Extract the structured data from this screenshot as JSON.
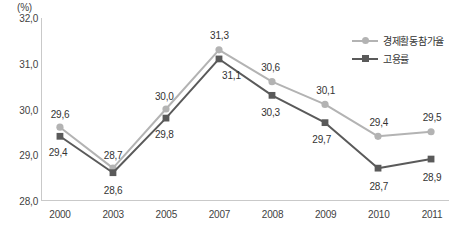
{
  "unit_label": "(%)",
  "colors": {
    "series_participation": "#b3b3b3",
    "series_employment": "#5a5a5a",
    "axis": "#c9c9c9",
    "text": "#333333",
    "background": "#ffffff"
  },
  "legend": {
    "position": "top-right",
    "items": [
      {
        "label": "경제활동참가율",
        "marker": "circle-marker",
        "color": "#b3b3b3"
      },
      {
        "label": "고용률",
        "marker": "square-marker",
        "color": "#5a5a5a"
      }
    ]
  },
  "y_axis": {
    "ticks": [
      "32,0",
      "31,0",
      "30,0",
      "29,0",
      "28,0"
    ],
    "min": 28.0,
    "max": 32.0,
    "step": 1.0
  },
  "x_axis": {
    "ticks": [
      "2000",
      "2003",
      "2005",
      "2007",
      "2008",
      "2009",
      "2010",
      "2011"
    ]
  },
  "data_labels": {
    "participation": [
      "29,6",
      "28,7",
      "30,0",
      "31,3",
      "30,6",
      "30,1",
      "29,4",
      "29,5"
    ],
    "employment": [
      "29,4",
      "28,6",
      "29,8",
      "31,1",
      "30,3",
      "29,7",
      "28,7",
      "28,9"
    ]
  },
  "chart_data": {
    "type": "line",
    "title": "",
    "subtitle": "",
    "xlabel": "",
    "ylabel": "(%)",
    "categories": [
      "2000",
      "2003",
      "2005",
      "2007",
      "2008",
      "2009",
      "2010",
      "2011"
    ],
    "series": [
      {
        "name": "경제활동참가율",
        "color": "#b3b3b3",
        "marker": "circle",
        "values": [
          29.6,
          28.7,
          30.0,
          31.3,
          30.6,
          30.1,
          29.4,
          29.5
        ]
      },
      {
        "name": "고용률",
        "color": "#5a5a5a",
        "marker": "square",
        "values": [
          29.4,
          28.6,
          29.8,
          31.1,
          30.3,
          29.7,
          28.7,
          28.9
        ]
      }
    ],
    "ylim": [
      28.0,
      32.0
    ],
    "yticks": [
      28.0,
      29.0,
      30.0,
      31.0,
      32.0
    ],
    "grid": false,
    "legend_position": "top-right",
    "decimal_separator": ","
  },
  "label_offsets": {
    "participation": [
      {
        "dx": 0,
        "dy": -14
      },
      {
        "dx": 0,
        "dy": -14
      },
      {
        "dx": -2,
        "dy": -14
      },
      {
        "dx": 0,
        "dy": -15
      },
      {
        "dx": -2,
        "dy": -15
      },
      {
        "dx": 0,
        "dy": -15
      },
      {
        "dx": 0,
        "dy": -15
      },
      {
        "dx": 0,
        "dy": -15
      }
    ],
    "employment": [
      {
        "dx": -2,
        "dy": 15
      },
      {
        "dx": 0,
        "dy": 16
      },
      {
        "dx": -2,
        "dy": 15
      },
      {
        "dx": 12,
        "dy": 16
      },
      {
        "dx": -2,
        "dy": 16
      },
      {
        "dx": -4,
        "dy": 16
      },
      {
        "dx": 0,
        "dy": 17
      },
      {
        "dx": 0,
        "dy": 17
      }
    ]
  }
}
